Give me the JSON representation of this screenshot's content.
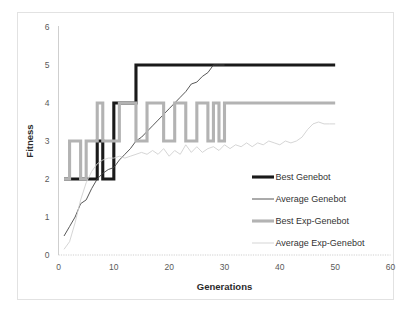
{
  "chart_data": {
    "type": "line",
    "title": "",
    "xlabel": "Generations",
    "ylabel": "Fitness",
    "xlim": [
      0,
      60
    ],
    "ylim": [
      0,
      6
    ],
    "xticks": [
      0,
      10,
      20,
      30,
      40,
      50,
      60
    ],
    "yticks": [
      0,
      1,
      2,
      3,
      4,
      5,
      6
    ],
    "xtick_labels": [
      "0",
      "10",
      "20",
      "30",
      "40",
      "50",
      "60"
    ],
    "ytick_labels": [
      "0",
      "1",
      "2",
      "3",
      "4",
      "5",
      "6"
    ],
    "grid": false,
    "legend_position": "inside-right",
    "colors": {
      "best_genebot": "#1a1a1a",
      "average_genebot": "#444444",
      "best_exp_genebot": "#b3b3b3",
      "average_exp_genebot": "#d0d0d0",
      "frame": "#e2e2e2",
      "axis": "#c9c9c9",
      "tick_text": "#5a5a5a",
      "axis_title": "#2b2b2b"
    },
    "series": [
      {
        "name": "Best Genebot",
        "style": "thick-dark",
        "x": [
          1,
          2,
          3,
          4,
          5,
          6,
          7,
          8,
          9,
          10,
          11,
          12,
          13,
          14,
          15,
          16,
          17,
          18,
          19,
          20,
          21,
          22,
          23,
          24,
          25,
          26,
          27,
          28,
          29,
          30,
          31,
          32,
          33,
          34,
          35,
          36,
          37,
          38,
          39,
          40,
          41,
          42,
          43,
          44,
          45,
          46,
          47,
          48,
          49,
          50
        ],
        "values": [
          2,
          2,
          2,
          2,
          2,
          2,
          3,
          2,
          2,
          4,
          4,
          4,
          4,
          5,
          5,
          5,
          5,
          5,
          5,
          5,
          5,
          5,
          5,
          5,
          5,
          5,
          5,
          5,
          5,
          5,
          5,
          5,
          5,
          5,
          5,
          5,
          5,
          5,
          5,
          5,
          5,
          5,
          5,
          5,
          5,
          5,
          5,
          5,
          5,
          5
        ]
      },
      {
        "name": "Average Genebot",
        "style": "thin-dark",
        "x": [
          1,
          2,
          3,
          4,
          5,
          6,
          7,
          8,
          9,
          10,
          11,
          12,
          13,
          14,
          15,
          16,
          17,
          18,
          19,
          20,
          21,
          22,
          23,
          24,
          25,
          26,
          27,
          28,
          29,
          30
        ],
        "values": [
          0.5,
          0.75,
          1.0,
          1.35,
          1.45,
          1.75,
          2.0,
          2.15,
          2.25,
          2.3,
          2.5,
          2.65,
          2.8,
          3.0,
          3.1,
          3.25,
          3.4,
          3.55,
          3.7,
          3.85,
          4.0,
          4.15,
          4.3,
          4.5,
          4.55,
          4.7,
          4.8,
          5.0,
          5.0,
          5.0
        ]
      },
      {
        "name": "Best Exp-Genebot",
        "style": "thick-gray",
        "x": [
          1,
          2,
          3,
          4,
          5,
          6,
          7,
          8,
          9,
          10,
          11,
          12,
          13,
          14,
          15,
          16,
          17,
          18,
          19,
          20,
          21,
          22,
          23,
          24,
          25,
          26,
          27,
          28,
          29,
          30,
          31,
          32,
          33,
          34,
          35,
          36,
          37,
          38,
          39,
          40,
          41,
          42,
          43,
          44,
          45,
          46,
          47,
          48,
          49,
          50
        ],
        "values": [
          2,
          3,
          3,
          2,
          3,
          3,
          4,
          3,
          3,
          3,
          4,
          4,
          4,
          3,
          3,
          4,
          4,
          4,
          3,
          3,
          4,
          4,
          3,
          3,
          4,
          4,
          3,
          4,
          3,
          4,
          4,
          4,
          4,
          4,
          4,
          4,
          4,
          4,
          4,
          4,
          4,
          4,
          4,
          4,
          4,
          4,
          4,
          4,
          4,
          4
        ]
      },
      {
        "name": "Average Exp-Genebot",
        "style": "thin-light",
        "x": [
          1,
          2,
          3,
          4,
          5,
          6,
          7,
          8,
          9,
          10,
          11,
          12,
          13,
          14,
          15,
          16,
          17,
          18,
          19,
          20,
          21,
          22,
          23,
          24,
          25,
          26,
          27,
          28,
          29,
          30,
          31,
          32,
          33,
          34,
          35,
          36,
          37,
          38,
          39,
          40,
          41,
          42,
          43,
          44,
          45,
          46,
          47,
          48,
          49,
          50
        ],
        "values": [
          0.15,
          0.35,
          0.85,
          1.45,
          1.9,
          2.2,
          2.4,
          2.5,
          2.55,
          2.55,
          2.6,
          2.55,
          2.6,
          2.65,
          2.7,
          2.65,
          2.75,
          2.65,
          2.8,
          2.6,
          2.75,
          2.65,
          2.9,
          2.7,
          2.85,
          2.7,
          2.8,
          2.85,
          2.75,
          2.9,
          2.8,
          2.9,
          2.85,
          2.95,
          2.85,
          2.95,
          2.9,
          3.0,
          2.95,
          2.9,
          3.0,
          2.95,
          3.0,
          3.1,
          3.3,
          3.45,
          3.5,
          3.45,
          3.45,
          3.45
        ]
      }
    ],
    "legend": [
      {
        "label": "Best Genebot",
        "style": "thick-dark"
      },
      {
        "label": "Average Genebot",
        "style": "thin-dark"
      },
      {
        "label": "Best Exp-Genebot",
        "style": "thick-gray"
      },
      {
        "label": "Average Exp-Genebot",
        "style": "thin-light"
      }
    ]
  }
}
